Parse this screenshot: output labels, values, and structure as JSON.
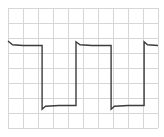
{
  "chart_data": {
    "type": "line",
    "title": "",
    "xlabel": "",
    "ylabel": "",
    "grid": true,
    "legend": null,
    "grid_divisions": {
      "x": 10,
      "y": 8
    },
    "xlim": [
      0,
      10
    ],
    "ylim": [
      0,
      8
    ],
    "colors": {
      "background": "#ffffff",
      "grid": "#d6d6d6",
      "trace": "#3c3c3c"
    },
    "series": [
      {
        "name": "square-wave",
        "x": [
          0,
          0.3,
          1.0,
          2.27,
          2.27,
          2.5,
          3.4,
          4.53,
          4.53,
          4.8,
          5.6,
          6.87,
          6.87,
          7.1,
          8.0,
          9.07,
          9.07,
          9.3,
          10
        ],
        "y": [
          5.8,
          5.55,
          5.5,
          5.5,
          1.25,
          1.45,
          1.5,
          1.5,
          5.75,
          5.55,
          5.5,
          5.5,
          1.25,
          1.45,
          1.5,
          1.5,
          5.75,
          5.55,
          5.5
        ]
      }
    ],
    "levels": {
      "high": 5.5,
      "low": 1.5
    },
    "period_divisions": 4.6
  }
}
